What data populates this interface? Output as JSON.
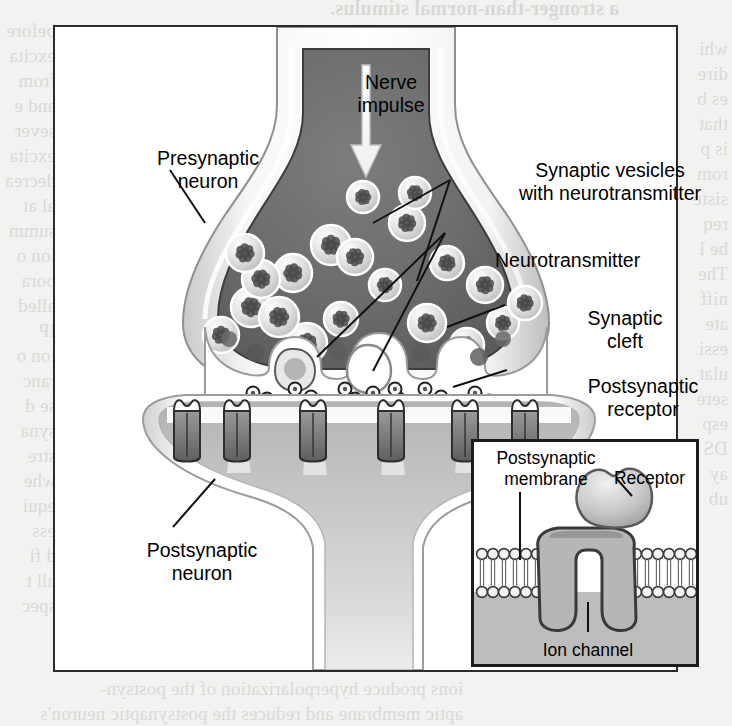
{
  "figure": {
    "labels": {
      "nerve_impulse": "Nerve\nimpulse",
      "presynaptic_neuron": "Presynaptic\nneuron",
      "synaptic_vesicles": "Synaptic vesicles\nwith neurotransmitter",
      "neurotransmitter": "Neurotransmitter",
      "synaptic_cleft": "Synaptic\ncleft",
      "postsynaptic_receptor": "Postsynaptic\nreceptor",
      "postsynaptic_neuron": "Postsynaptic\nneuron"
    },
    "inset": {
      "postsynaptic_membrane": "Postsynaptic\nmembrane",
      "receptor": "Receptor",
      "ion_channel": "Ion channel"
    },
    "colors": {
      "frame_border": "#2b2b2b",
      "inset_border": "#1c1c1c",
      "cytoplasm": "#6e6e6e",
      "membrane_light": "#f4f4f4",
      "membrane_outline": "#8c8c8c",
      "vesicle_fill": "#d9d9d9",
      "vesicle_core": "#4a4a4a",
      "postsynaptic_fill": "#c9c9c9",
      "receptor_protein": "#7a7a7a",
      "page_background": "#f2f2f0",
      "label_text": "#000000",
      "leader_line": "#111111"
    }
  },
  "page_bleed": {
    "top": "a stronger-than-normal stimulus.",
    "left": "before\nexcita\nfrom\nand e\nsever\nexcita\ndecrea\nal at\nsumm\nion o\npora\nalled\nIP\nion o\nranc\nse d\nsyna\nstre\nwhe\nequi\ness\nd fi\nall t\nspec",
    "right": "whi\ndire\nes b\nthat\nis p\nrom\nsiste\nreq\nbe l\nThe\nniff\nate\nessi\nulat\nsere\nesp\nDS\nay\nub",
    "bottom": "ions produce hyperpolarization of the postsyn-\naptic membrane and reduces the postsynaptic neuron's",
    "middle": "b. A synapse is\nchemical transmi\nPresynaptic"
  }
}
